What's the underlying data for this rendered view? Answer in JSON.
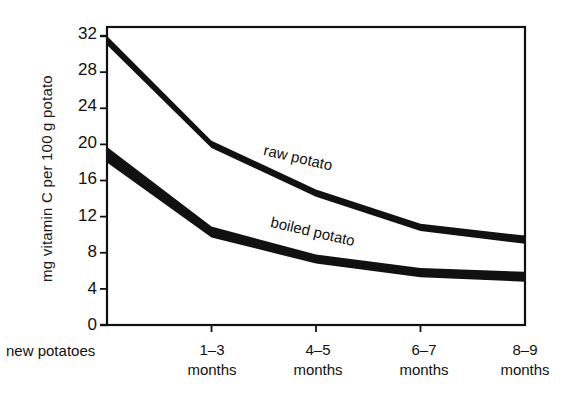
{
  "chart_data": {
    "type": "area",
    "title": "",
    "xlabel": "",
    "ylabel": "mg vitamin C per 100 g potato",
    "origin_label": "new potatoes",
    "categories": [
      "new potatoes",
      "1-3 months",
      "4-5 months",
      "6-7 months",
      "8-9 months"
    ],
    "x": [
      0,
      1,
      2,
      3,
      4
    ],
    "ylim": [
      0,
      33
    ],
    "yticks": [
      0,
      4,
      8,
      12,
      16,
      20,
      24,
      28,
      32
    ],
    "grid": false,
    "legend_position": "inline-labels",
    "series": [
      {
        "name": "raw potato",
        "label": "raw potato",
        "color": "#111111",
        "upper": [
          32.0,
          20.4,
          15.0,
          11.2,
          9.9
        ],
        "lower": [
          31.0,
          19.6,
          14.2,
          10.4,
          9.0
        ],
        "values": [
          31.5,
          20.0,
          14.6,
          10.8,
          9.4
        ]
      },
      {
        "name": "boiled potato",
        "label": "boiled potato",
        "color": "#111111",
        "upper": [
          19.7,
          10.9,
          7.8,
          6.3,
          5.9
        ],
        "lower": [
          18.0,
          9.7,
          6.8,
          5.3,
          4.8
        ],
        "values": [
          18.8,
          10.3,
          7.3,
          5.8,
          5.3
        ]
      }
    ]
  },
  "axis": {
    "ylabel": "mg vitamin C per 100 g potato",
    "ytick_labels": [
      "32",
      "28",
      "24",
      "20",
      "16",
      "12",
      "8",
      "4",
      "0"
    ],
    "xtick_labels": [
      {
        "line1": "1–3",
        "line2": "months"
      },
      {
        "line1": "4–5",
        "line2": "months"
      },
      {
        "line1": "6–7",
        "line2": "months"
      },
      {
        "line1": "8–9",
        "line2": "months"
      }
    ],
    "origin_label": "new potatoes"
  },
  "labels": {
    "raw": "raw potato",
    "boiled": "boiled potato"
  },
  "colors": {
    "ink": "#111111",
    "background": "#ffffff",
    "band": "#111111"
  }
}
